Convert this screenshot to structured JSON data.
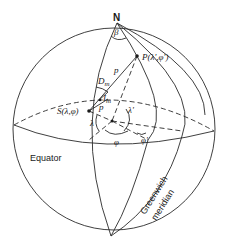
{
  "figure": {
    "type": "spherical-geometry-diagram",
    "labels": {
      "north_pole": "N",
      "angle_beta": "β",
      "point_p": "P(λ',φ')",
      "arc_p": "p",
      "d_m": "D",
      "d_m_sub": "m",
      "i_m": "I",
      "i_m_sub": "m",
      "point_s": "S(λ,φ)",
      "small_p": "p",
      "lambda_prime": "λ'",
      "lambda": "λ",
      "phi": "φ",
      "phi_prime": "φ'",
      "equator": "Equator",
      "greenwich_line1": "Greenwich",
      "greenwich_line2": "meridian"
    },
    "colors": {
      "line": "#2a2a2a",
      "text": "#1a1a1a",
      "background": "#ffffff"
    }
  }
}
